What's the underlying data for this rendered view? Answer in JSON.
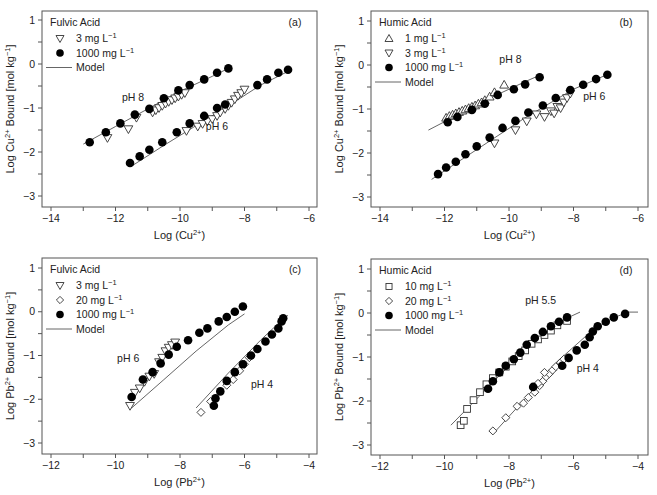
{
  "figure": {
    "panels": [
      "a",
      "b",
      "c",
      "d"
    ]
  },
  "chart_data": [
    {
      "id": "a",
      "type": "scatter",
      "panel_label": "(a)",
      "title": "Fulvic Acid",
      "xlabel": "Log (Cu2+)",
      "ylabel": "Log Cu2+ Bound [mol kg-1]",
      "xlim": [
        -14.2,
        -5.8
      ],
      "ylim": [
        -3.25,
        1.25
      ],
      "xticks": [
        -14,
        -12,
        -10,
        -8,
        -6
      ],
      "yticks": [
        1,
        0,
        -1,
        -2,
        -3
      ],
      "legend": [
        {
          "marker": "tri-down",
          "label": "3 mg L",
          "sup": "−1"
        },
        {
          "marker": "circle",
          "label": "1000 mg L",
          "sup": "−1"
        },
        {
          "marker": "line",
          "label": "Model",
          "sup": ""
        }
      ],
      "annotations": [
        {
          "text": "pH 8",
          "x": -11.8,
          "y": -0.85
        },
        {
          "text": "pH 6",
          "x": -9.2,
          "y": -1.5
        }
      ],
      "series": [
        {
          "name": "3 mg L-1 pH 8",
          "marker": "tri-down",
          "x": [
            -12.25,
            -11.6,
            -11.35,
            -10.85,
            -10.75,
            -10.65,
            -10.55,
            -10.45,
            -10.35,
            -10.25,
            -10.15,
            -10.05,
            -9.95,
            -9.85
          ],
          "y": [
            -1.68,
            -1.48,
            -1.22,
            -1.1,
            -1.05,
            -1.0,
            -0.95,
            -0.9,
            -0.86,
            -0.82,
            -0.78,
            -0.74,
            -0.7,
            -0.66
          ]
        },
        {
          "name": "1000 mg L-1 pH 8",
          "marker": "circle",
          "x": [
            -12.8,
            -12.3,
            -11.85,
            -11.4,
            -10.95,
            -10.5,
            -10.05,
            -9.7,
            -9.25,
            -8.85,
            -8.5
          ],
          "y": [
            -1.78,
            -1.55,
            -1.35,
            -1.15,
            -1.02,
            -0.78,
            -0.6,
            -0.48,
            -0.35,
            -0.2,
            -0.1
          ]
        },
        {
          "name": "3 mg L-1 pH 6",
          "marker": "tri-down",
          "x": [
            -9.8,
            -9.45,
            -9.3,
            -9.15,
            -9.0,
            -8.85,
            -8.75,
            -8.6,
            -8.5,
            -8.4,
            -8.3,
            -8.2,
            -8.1,
            -8.0
          ],
          "y": [
            -1.52,
            -1.42,
            -1.36,
            -1.3,
            -1.25,
            -1.18,
            -1.1,
            -1.02,
            -0.95,
            -0.88,
            -0.8,
            -0.72,
            -0.66,
            -0.58
          ]
        },
        {
          "name": "1000 mg L-1 pH 6",
          "marker": "circle",
          "x": [
            -11.55,
            -11.25,
            -10.95,
            -10.55,
            -10.1,
            -9.7,
            -9.25,
            -8.85,
            -8.6,
            -7.6,
            -7.3,
            -6.95,
            -6.65
          ],
          "y": [
            -2.25,
            -2.1,
            -1.95,
            -1.78,
            -1.55,
            -1.35,
            -1.18,
            -1.0,
            -0.92,
            -0.48,
            -0.35,
            -0.2,
            -0.13
          ]
        }
      ],
      "model_lines": [
        {
          "x": [
            -13.0,
            -12.0,
            -11.0,
            -10.0,
            -9.0,
            -8.5
          ],
          "y": [
            -1.82,
            -1.42,
            -1.02,
            -0.62,
            -0.28,
            -0.1
          ]
        },
        {
          "x": [
            -11.5,
            -10.5,
            -9.5,
            -8.5,
            -7.5,
            -6.6
          ],
          "y": [
            -2.32,
            -1.85,
            -1.4,
            -0.95,
            -0.48,
            -0.15
          ]
        }
      ]
    },
    {
      "id": "b",
      "type": "scatter",
      "panel_label": "(b)",
      "title": "Humic Acid",
      "xlabel": "Log (Cu2+)",
      "ylabel": "Log Cu2+ Bound [mol kg-1]",
      "xlim": [
        -14.2,
        -5.8
      ],
      "ylim": [
        -3.25,
        1.25
      ],
      "xticks": [
        -14,
        -12,
        -10,
        -8,
        -6
      ],
      "yticks": [
        1,
        0,
        -1,
        -2,
        -3
      ],
      "legend": [
        {
          "marker": "tri-up",
          "label": "1 mg L",
          "sup": "−1"
        },
        {
          "marker": "tri-down",
          "label": "3 mg L",
          "sup": "−1"
        },
        {
          "marker": "circle",
          "label": "1000 mg L",
          "sup": "−1"
        },
        {
          "marker": "line",
          "label": "Model",
          "sup": ""
        }
      ],
      "annotations": [
        {
          "text": "pH 8",
          "x": -10.3,
          "y": 0.05
        },
        {
          "text": "pH 6",
          "x": -7.7,
          "y": -0.8
        }
      ],
      "series": [
        {
          "name": "1 mg L-1 pH 8",
          "marker": "tri-up",
          "x": [
            -11.95,
            -11.85,
            -11.75,
            -11.65,
            -11.55,
            -11.45,
            -11.35,
            -11.25,
            -11.15,
            -11.05,
            -10.95,
            -10.85,
            -10.75,
            -10.6,
            -10.45,
            -10.15
          ],
          "y": [
            -1.2,
            -1.16,
            -1.13,
            -1.1,
            -1.07,
            -1.04,
            -1.01,
            -0.98,
            -0.95,
            -0.92,
            -0.88,
            -0.85,
            -0.8,
            -0.72,
            -0.62,
            -0.45
          ]
        },
        {
          "name": "1000 mg L-1 pH 8",
          "marker": "circle",
          "x": [
            -11.9,
            -11.6,
            -11.15,
            -10.75,
            -10.35,
            -9.85,
            -9.5,
            -9.05
          ],
          "y": [
            -1.3,
            -1.18,
            -1.02,
            -0.88,
            -0.68,
            -0.55,
            -0.44,
            -0.28
          ]
        },
        {
          "name": "3 mg L-1 pH 6",
          "marker": "tri-down",
          "x": [
            -10.45,
            -9.8,
            -9.45,
            -9.15,
            -8.9,
            -8.7,
            -8.6,
            -8.5,
            -8.4,
            -8.3,
            -8.2,
            -8.1
          ],
          "y": [
            -1.78,
            -1.48,
            -1.28,
            -1.12,
            -1.18,
            -1.05,
            -1.1,
            -0.95,
            -0.98,
            -0.85,
            -0.75,
            -0.65
          ]
        },
        {
          "name": "1000 mg L-1 pH 6",
          "marker": "circle",
          "x": [
            -12.2,
            -11.95,
            -11.65,
            -11.35,
            -11.0,
            -10.6,
            -10.2,
            -9.8,
            -9.4,
            -8.95,
            -8.55,
            -8.1,
            -7.7,
            -7.3,
            -6.95
          ],
          "y": [
            -2.48,
            -2.33,
            -2.2,
            -2.03,
            -1.85,
            -1.65,
            -1.43,
            -1.27,
            -1.08,
            -0.92,
            -0.75,
            -0.57,
            -0.45,
            -0.32,
            -0.22
          ]
        }
      ],
      "model_lines": [
        {
          "x": [
            -12.5,
            -11.5,
            -10.5,
            -9.5,
            -9.1
          ],
          "y": [
            -1.48,
            -1.1,
            -0.72,
            -0.38,
            -0.25
          ]
        },
        {
          "x": [
            -12.4,
            -11.0,
            -9.5,
            -8.0,
            -6.9
          ],
          "y": [
            -2.6,
            -1.92,
            -1.2,
            -0.55,
            -0.2
          ]
        }
      ]
    },
    {
      "id": "c",
      "type": "scatter",
      "panel_label": "(c)",
      "title": "Fulvic Acid",
      "xlabel": "Log (Pb2+)",
      "ylabel": "Log Pb2+ Bound [mol kg-1]",
      "xlim": [
        -12.2,
        -3.8
      ],
      "ylim": [
        -3.25,
        1.25
      ],
      "xticks": [
        -12,
        -10,
        -8,
        -6,
        -4
      ],
      "yticks": [
        1,
        0,
        -1,
        -2,
        -3
      ],
      "legend": [
        {
          "marker": "tri-down",
          "label": "3 mg L",
          "sup": "−1"
        },
        {
          "marker": "diamond",
          "label": "20 mg L",
          "sup": "−1"
        },
        {
          "marker": "circle",
          "label": "1000 mg L",
          "sup": "−1"
        },
        {
          "marker": "line",
          "label": "Model",
          "sup": ""
        }
      ],
      "annotations": [
        {
          "text": "pH 6",
          "x": -9.95,
          "y": -1.15
        },
        {
          "text": "pH 4",
          "x": -5.8,
          "y": -1.75
        }
      ],
      "series": [
        {
          "name": "3 mg L-1 pH 6",
          "marker": "tri-down",
          "x": [
            -9.55,
            -9.4,
            -9.25,
            -9.1,
            -8.95,
            -8.8,
            -8.65,
            -8.55,
            -8.45,
            -8.35,
            -8.25,
            -8.15
          ],
          "y": [
            -2.15,
            -1.85,
            -1.75,
            -1.6,
            -1.48,
            -1.42,
            -1.15,
            -1.05,
            -0.9,
            -0.82,
            -0.76,
            -0.7
          ]
        },
        {
          "name": "1000 mg L-1 pH 6",
          "marker": "circle",
          "x": [
            -9.5,
            -9.15,
            -8.85,
            -8.6,
            -8.35,
            -8.1,
            -7.75,
            -7.4,
            -7.15,
            -6.8,
            -6.55,
            -6.3,
            -6.05
          ],
          "y": [
            -1.95,
            -1.55,
            -1.38,
            -1.18,
            -0.98,
            -0.8,
            -0.65,
            -0.48,
            -0.38,
            -0.22,
            -0.12,
            0.0,
            0.12
          ]
        },
        {
          "name": "20 mg L-1 pH 4",
          "marker": "diamond",
          "x": [
            -7.35,
            -7.05,
            -6.55,
            -6.35,
            -6.15,
            -6.0,
            -5.85
          ],
          "y": [
            -2.3,
            -2.05,
            -1.68,
            -1.55,
            -1.35,
            -1.2,
            -1.05
          ]
        },
        {
          "name": "1000 mg L-1 pH 4",
          "marker": "circle",
          "x": [
            -6.95,
            -6.9,
            -6.75,
            -6.55,
            -6.3,
            -6.05,
            -5.8,
            -5.6,
            -5.35,
            -5.15,
            -4.95,
            -4.85,
            -4.8
          ],
          "y": [
            -2.15,
            -1.98,
            -1.82,
            -1.58,
            -1.38,
            -1.2,
            -1.0,
            -0.85,
            -0.68,
            -0.52,
            -0.38,
            -0.22,
            -0.15
          ]
        }
      ],
      "model_lines": [
        {
          "x": [
            -9.5,
            -8.5,
            -7.5,
            -6.5,
            -6.0
          ],
          "y": [
            -2.2,
            -1.55,
            -0.9,
            -0.3,
            -0.05
          ]
        },
        {
          "x": [
            -7.5,
            -6.5,
            -5.5,
            -5.0,
            -4.65
          ],
          "y": [
            -2.2,
            -1.4,
            -0.65,
            -0.3,
            -0.08
          ]
        }
      ]
    },
    {
      "id": "d",
      "type": "scatter",
      "panel_label": "(d)",
      "title": "Humic Acid",
      "xlabel": "Log (Pb2+)",
      "ylabel": "Log Pb2+ Bound [mol kg-1]",
      "xlim": [
        -12.2,
        -3.8
      ],
      "ylim": [
        -3.25,
        1.25
      ],
      "xticks": [
        -12,
        -10,
        -8,
        -6,
        -4
      ],
      "yticks": [
        1,
        0,
        -1,
        -2,
        -3
      ],
      "legend": [
        {
          "marker": "square",
          "label": "10 mg L",
          "sup": "−1"
        },
        {
          "marker": "diamond",
          "label": "20 mg L",
          "sup": "−1"
        },
        {
          "marker": "circle",
          "label": "1000 mg L",
          "sup": "−1"
        },
        {
          "marker": "line",
          "label": "Model",
          "sup": ""
        }
      ],
      "annotations": [
        {
          "text": "pH 5.5",
          "x": -7.5,
          "y": 0.2
        },
        {
          "text": "pH 4",
          "x": -5.9,
          "y": -1.35
        }
      ],
      "series": [
        {
          "name": "10 mg L-1 pH 5.5",
          "marker": "square",
          "x": [
            -9.5,
            -9.4,
            -9.3,
            -9.1,
            -8.9,
            -8.7,
            -8.5,
            -8.3,
            -8.1,
            -7.9,
            -7.7,
            -7.5,
            -7.3,
            -7.1,
            -6.9,
            -6.7,
            -6.5,
            -6.2
          ],
          "y": [
            -2.55,
            -2.45,
            -2.18,
            -1.98,
            -1.8,
            -1.62,
            -1.48,
            -1.35,
            -1.22,
            -1.1,
            -0.98,
            -0.85,
            -0.7,
            -0.6,
            -0.5,
            -0.4,
            -0.28,
            -0.18
          ]
        },
        {
          "name": "1000 mg L-1 pH 5.5",
          "marker": "circle",
          "x": [
            -8.65,
            -8.5,
            -8.3,
            -8.1,
            -7.85,
            -7.65,
            -7.45,
            -7.2,
            -6.95,
            -6.7,
            -6.45,
            -6.2
          ],
          "y": [
            -1.72,
            -1.55,
            -1.35,
            -1.2,
            -1.05,
            -0.9,
            -0.72,
            -0.57,
            -0.43,
            -0.3,
            -0.2,
            -0.1
          ]
        },
        {
          "name": "20 mg L-1 pH 4",
          "marker": "diamond",
          "x": [
            -8.5,
            -8.1,
            -7.75,
            -7.55,
            -7.4,
            -7.2,
            -7.05,
            -6.95,
            -6.85,
            -6.75,
            -6.65,
            -6.55,
            -6.4,
            -6.3,
            -6.9,
            -7.1
          ],
          "y": [
            -2.68,
            -2.38,
            -2.12,
            -2.05,
            -1.92,
            -1.8,
            -1.65,
            -1.55,
            -1.45,
            -1.38,
            -1.3,
            -1.22,
            -1.12,
            -1.05,
            -1.35,
            -1.6
          ]
        },
        {
          "name": "1000 mg L-1 pH 4",
          "marker": "circle",
          "x": [
            -7.25,
            -6.35,
            -6.15,
            -5.9,
            -5.65,
            -5.5,
            -5.4,
            -5.25,
            -5.0,
            -4.75,
            -4.4
          ],
          "y": [
            -1.68,
            -1.2,
            -1.02,
            -0.85,
            -0.72,
            -0.55,
            -0.42,
            -0.3,
            -0.2,
            -0.1,
            -0.02
          ]
        }
      ],
      "model_lines": [
        {
          "x": [
            -9.8,
            -9.0,
            -8.0,
            -7.0,
            -6.3,
            -5.8
          ],
          "y": [
            -2.55,
            -1.95,
            -1.2,
            -0.55,
            -0.15,
            0.02
          ]
        },
        {
          "x": [
            -8.5,
            -7.5,
            -6.5,
            -5.5,
            -4.8,
            -4.3,
            -4.0
          ],
          "y": [
            -2.75,
            -1.95,
            -1.1,
            -0.45,
            -0.12,
            0.02,
            0.02
          ]
        }
      ]
    }
  ]
}
